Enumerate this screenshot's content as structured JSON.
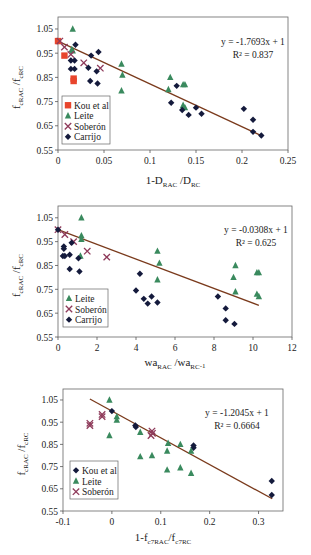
{
  "colors": {
    "kou": "#e8452c",
    "leite": "#3a8a5e",
    "soberon": "#8e3a5a",
    "carrijo": "#141a3c",
    "trend": "#7a3a1c",
    "axis": "#555555"
  },
  "chart_data": [
    {
      "type": "scatter",
      "title": "",
      "xlabel": "1-D_RAC /D_RC",
      "xlabel_main": "1-D",
      "xlabel_sub1": "RAC",
      "xlabel_mid": " /D",
      "xlabel_sub2": "RC",
      "ylabel": "f_cRAC /f_cRC",
      "xlim": [
        0,
        0.25
      ],
      "ylim": [
        0.55,
        1.1
      ],
      "xticks": [
        0,
        0.05,
        0.1,
        0.15,
        0.2,
        0.25
      ],
      "xtick_labels": [
        "0",
        "0.05",
        "0.1",
        "0.15",
        "0.2",
        "0.25"
      ],
      "yticks": [
        0.55,
        0.65,
        0.75,
        0.85,
        0.95,
        1.05
      ],
      "ytick_labels": [
        "0.55",
        "0.65",
        "0.75",
        "0.85",
        "0.95",
        "1.05"
      ],
      "equation": "y = -1.7693x + 1",
      "r2": "R² = 0.837",
      "trendline": {
        "slope": -1.7693,
        "intercept": 1,
        "x_range": [
          0,
          0.222
        ]
      },
      "legend": [
        "Kou et al",
        "Leite",
        "Soberón",
        "Carrijo"
      ],
      "series": [
        {
          "name": "Kou et al",
          "marker": "square",
          "points": [
            [
              0,
              1.0
            ],
            [
              0.007,
              0.94
            ],
            [
              0.017,
              0.845
            ],
            [
              0.017,
              0.835
            ]
          ]
        },
        {
          "name": "Leite",
          "marker": "triangle",
          "points": [
            [
              0.016,
              1.05
            ],
            [
              0.015,
              0.965
            ],
            [
              0.016,
              0.96
            ],
            [
              0.069,
              0.905
            ],
            [
              0.07,
              0.86
            ],
            [
              0.069,
              0.795
            ],
            [
              0.122,
              0.85
            ],
            [
              0.12,
              0.8
            ],
            [
              0.136,
              0.82
            ],
            [
              0.138,
              0.82
            ],
            [
              0.136,
              0.735
            ],
            [
              0.138,
              0.725
            ]
          ]
        },
        {
          "name": "Soberón",
          "marker": "cross",
          "points": [
            [
              0.002,
              1.0
            ],
            [
              0.007,
              0.975
            ],
            [
              0.014,
              0.945
            ],
            [
              0.028,
              0.91
            ],
            [
              0.046,
              0.888
            ]
          ]
        },
        {
          "name": "Carrijo",
          "marker": "diamond",
          "points": [
            [
              0.019,
              0.985
            ],
            [
              0.044,
              0.955
            ],
            [
              0.036,
              0.94
            ],
            [
              0.014,
              0.92
            ],
            [
              0.018,
              0.92
            ],
            [
              0.014,
              0.885
            ],
            [
              0.018,
              0.885
            ],
            [
              0.033,
              0.89
            ],
            [
              0.042,
              0.875
            ],
            [
              0.035,
              0.835
            ],
            [
              0.043,
              0.825
            ],
            [
              0.129,
              0.815
            ],
            [
              0.123,
              0.745
            ],
            [
              0.135,
              0.715
            ],
            [
              0.15,
              0.725
            ],
            [
              0.142,
              0.695
            ],
            [
              0.156,
              0.7
            ],
            [
              0.202,
              0.72
            ],
            [
              0.212,
              0.675
            ],
            [
              0.212,
              0.625
            ],
            [
              0.221,
              0.61
            ]
          ]
        }
      ]
    },
    {
      "type": "scatter",
      "title": "",
      "xlabel": "wa_RAC /wa_RC -1",
      "xlabel_main": "wa",
      "xlabel_sub1": "RAC",
      "xlabel_mid": " /wa",
      "xlabel_sub2": "RC",
      "xlabel_sup": "-1",
      "ylabel": "f_cRAC /f_cRC",
      "xlim": [
        0,
        12
      ],
      "ylim": [
        0.55,
        1.1
      ],
      "xticks": [
        0,
        2,
        4,
        6,
        8,
        10,
        12
      ],
      "xtick_labels": [
        "0",
        "2",
        "4",
        "6",
        "8",
        "10",
        "12"
      ],
      "yticks": [
        0.55,
        0.65,
        0.75,
        0.85,
        0.95,
        1.05
      ],
      "ytick_labels": [
        "0.55",
        "0.65",
        "0.75",
        "0.85",
        "0.95",
        "1.05"
      ],
      "equation": "y = -0.0308x + 1",
      "r2": "R² = 0.625",
      "trendline": {
        "slope": -0.0308,
        "intercept": 1,
        "x_range": [
          0,
          10.3
        ]
      },
      "legend": [
        "Leite",
        "Soberón",
        "Carrijo"
      ],
      "series": [
        {
          "name": "Leite",
          "marker": "triangle",
          "points": [
            [
              1.2,
              1.05
            ],
            [
              1.2,
              0.975
            ],
            [
              1.2,
              0.96
            ],
            [
              1.15,
              0.89
            ],
            [
              5.1,
              0.91
            ],
            [
              5.2,
              0.86
            ],
            [
              5.1,
              0.79
            ],
            [
              9.1,
              0.85
            ],
            [
              9.0,
              0.8
            ],
            [
              9.1,
              0.74
            ],
            [
              10.2,
              0.82
            ],
            [
              10.3,
              0.82
            ],
            [
              10.2,
              0.73
            ],
            [
              10.3,
              0.72
            ]
          ]
        },
        {
          "name": "Soberón",
          "marker": "cross",
          "points": [
            [
              0.0,
              1.0
            ],
            [
              0.35,
              0.98
            ],
            [
              0.8,
              0.95
            ],
            [
              1.5,
              0.91
            ],
            [
              2.5,
              0.885
            ]
          ]
        },
        {
          "name": "Carrijo",
          "marker": "diamond",
          "points": [
            [
              0.0,
              1.0
            ],
            [
              0.3,
              0.93
            ],
            [
              0.3,
              0.92
            ],
            [
              0.7,
              0.945
            ],
            [
              0.25,
              0.89
            ],
            [
              0.35,
              0.89
            ],
            [
              0.6,
              0.895
            ],
            [
              1.05,
              0.88
            ],
            [
              0.6,
              0.835
            ],
            [
              1.1,
              0.825
            ],
            [
              4.2,
              0.815
            ],
            [
              4.0,
              0.745
            ],
            [
              4.4,
              0.71
            ],
            [
              4.6,
              0.69
            ],
            [
              4.8,
              0.72
            ],
            [
              5.1,
              0.695
            ],
            [
              8.2,
              0.72
            ],
            [
              8.6,
              0.67
            ],
            [
              8.6,
              0.62
            ],
            [
              9.05,
              0.605
            ]
          ]
        }
      ]
    },
    {
      "type": "scatter",
      "title": "",
      "xlabel": "1-f_c7RAC/f_c7RC",
      "xlabel_main": "1-f",
      "xlabel_sub1": "c7RAC",
      "xlabel_mid": "/f",
      "xlabel_sub2": "c7RC",
      "ylabel": "f_cRAC /f_cRC",
      "xlim": [
        -0.1,
        0.35
      ],
      "ylim": [
        0.55,
        1.1
      ],
      "xticks": [
        -0.1,
        0,
        0.1,
        0.2,
        0.3
      ],
      "xtick_labels": [
        "-0.1",
        "0",
        "0.1",
        "0.2",
        "0.3"
      ],
      "yticks": [
        0.55,
        0.65,
        0.75,
        0.85,
        0.95,
        1.05
      ],
      "ytick_labels": [
        "0.55",
        "0.65",
        "0.75",
        "0.85",
        "0.95",
        "1.05"
      ],
      "equation": "y = -1.2045x + 1",
      "r2": "R² = 0.6664",
      "trendline": {
        "slope": -1.2045,
        "intercept": 1,
        "x_range": [
          -0.045,
          0.328
        ]
      },
      "legend": [
        "Kou et al",
        "Leite",
        "Soberón"
      ],
      "series": [
        {
          "name": "Kou et al",
          "marker": "diamond",
          "points": [
            [
              0.0,
              1.0
            ],
            [
              0.048,
              0.935
            ],
            [
              0.049,
              0.928
            ],
            [
              0.167,
              0.845
            ],
            [
              0.167,
              0.835
            ],
            [
              0.327,
              0.685
            ],
            [
              0.327,
              0.622
            ]
          ]
        },
        {
          "name": "Leite",
          "marker": "triangle",
          "points": [
            [
              -0.005,
              1.05
            ],
            [
              0.01,
              0.975
            ],
            [
              0.01,
              0.96
            ],
            [
              -0.005,
              0.89
            ],
            [
              0.058,
              0.905
            ],
            [
              0.058,
              0.795
            ],
            [
              0.082,
              0.8
            ],
            [
              0.115,
              0.855
            ],
            [
              0.113,
              0.82
            ],
            [
              0.14,
              0.85
            ],
            [
              0.162,
              0.82
            ],
            [
              0.113,
              0.735
            ],
            [
              0.14,
              0.745
            ],
            [
              0.162,
              0.72
            ]
          ]
        },
        {
          "name": "Soberón",
          "marker": "cross",
          "points": [
            [
              -0.045,
              0.945
            ],
            [
              -0.045,
              0.935
            ],
            [
              -0.02,
              0.985
            ],
            [
              -0.02,
              0.975
            ],
            [
              0.08,
              0.89
            ],
            [
              0.082,
              0.91
            ],
            [
              0.083,
              0.9
            ]
          ]
        }
      ]
    }
  ],
  "layout": [
    {
      "top": 0,
      "height": 190,
      "plot": {
        "x0": 58,
        "y0": 17,
        "x1": 288,
        "y1": 150
      },
      "legend": {
        "x": 62,
        "y": 96,
        "w": 48,
        "h": 48
      },
      "eq": {
        "x": 253,
        "y": 45
      },
      "xlabel_y": 184,
      "ylabel_x": 20
    },
    {
      "top": 190,
      "height": 185,
      "plot": {
        "x0": 58,
        "y0": 16,
        "x1": 292,
        "y1": 147
      },
      "legend": {
        "x": 63,
        "y": 99,
        "w": 45,
        "h": 38
      },
      "eq": {
        "x": 256,
        "y": 43
      },
      "xlabel_y": 176,
      "ylabel_x": 20
    },
    {
      "top": 375,
      "height": 180,
      "plot": {
        "x0": 63,
        "y0": 14,
        "x1": 283,
        "y1": 136
      },
      "legend": {
        "x": 70,
        "y": 86,
        "w": 48,
        "h": 38
      },
      "eq": {
        "x": 237,
        "y": 41
      },
      "xlabel_y": 166,
      "ylabel_x": 25
    }
  ]
}
